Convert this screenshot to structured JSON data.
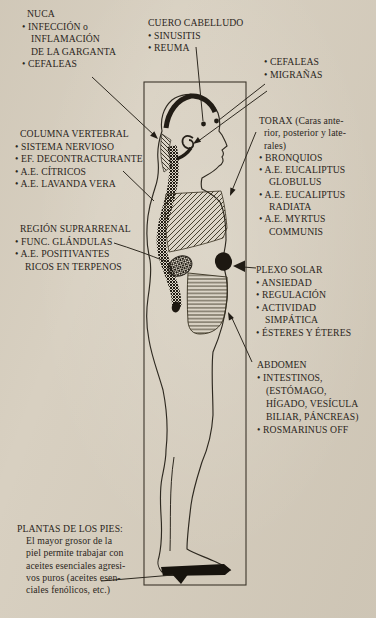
{
  "colors": {
    "paper": "#d8d0c1",
    "ink": "#2b261c",
    "line": "#2e2920",
    "solid_black": "#1d1811"
  },
  "figure_regions": [
    "scalp",
    "nape",
    "spine",
    "thorax",
    "suprarrenal-gland",
    "solar-plexus",
    "abdomen",
    "foot-sole"
  ],
  "labels": {
    "nuca": {
      "lines": [
        "NUCA",
        "• INFECCIÓN o",
        "INFLAMACIÓN",
        "DE LA GARGANTA",
        "• CEFALEAS"
      ]
    },
    "cuero": {
      "lines": [
        "CUERO CABELLUDO",
        "• SINUSITIS",
        "• REUMA"
      ]
    },
    "cefaleas": {
      "lines": [
        "• CEFALEAS",
        "• MIGRAÑAS"
      ]
    },
    "torax": {
      "lines": [
        "TORAX (Caras ante-",
        "rior, posterior y late-",
        "rales)",
        "• BRONQUIOS",
        "• A.E. EUCALIPTUS",
        "GLOBULUS",
        "• A.E. EUCALIPTUS",
        "RADIATA",
        "• A.E. MYRTUS",
        "COMMUNIS"
      ]
    },
    "columna": {
      "lines": [
        "COLUMNA VERTEBRAL",
        "• SISTEMA NERVIOSO",
        "• EF. DECONTRACTURANTE",
        "• A.E. CÍTRICOS",
        "• A.E. LAVANDA VERA"
      ]
    },
    "suprarrenal": {
      "lines": [
        "REGIÓN SUPRARRENAL",
        "• FUNC. GLÁNDULAS",
        "• A.E. POSITIVANTES",
        "RICOS EN TERPENOS"
      ]
    },
    "plexo": {
      "lines": [
        "PLEXO SOLAR",
        "• ANSIEDAD",
        "• REGULACIÓN",
        "• ACTIVIDAD",
        "SIMPÁTICA",
        "• ÉSTERES Y ÉTERES"
      ]
    },
    "abdomen": {
      "lines": [
        "ABDOMEN",
        "• INTESTINOS,",
        "(ESTÓMAGO,",
        "HÍGADO, VESÍCULA",
        "BILIAR, PÁNCREAS)",
        "• ROSMARINUS OFF"
      ]
    },
    "plantas": {
      "lines": [
        "PLANTAS DE LOS PIES:",
        "El mayor grosor de la",
        "piel permite trabajar con",
        "aceites esenciales agresi-",
        "vos puros (aceites esen-",
        "ciales fenólicos, etc.)"
      ]
    }
  }
}
